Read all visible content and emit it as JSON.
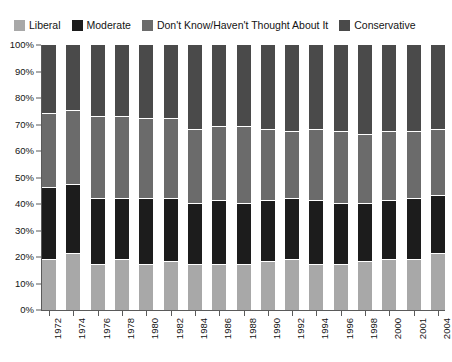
{
  "legend": {
    "position": "top",
    "items": [
      {
        "label": "Liberal",
        "color": "#a8a8a8",
        "icon": "legend-swatch-icon"
      },
      {
        "label": "Moderate",
        "color": "#1c1c1c",
        "icon": "legend-swatch-icon"
      },
      {
        "label": "Don't Know/Haven't Thought About It",
        "color": "#6b6b6b",
        "icon": "legend-swatch-icon"
      },
      {
        "label": "Conservative",
        "color": "#4a4a4a",
        "icon": "legend-swatch-icon"
      }
    ]
  },
  "axes": {
    "y_ticks": [
      "100%",
      "90%",
      "80%",
      "70%",
      "60%",
      "50%",
      "40%",
      "30%",
      "20%",
      "10%",
      "0%"
    ],
    "ylim": [
      0,
      100
    ],
    "grid": false
  },
  "chart_data": {
    "type": "bar",
    "title": "",
    "xlabel": "",
    "ylabel": "",
    "ylim": [
      0,
      100
    ],
    "grid": false,
    "stacked": true,
    "stack_order_bottom_to_top": [
      "Liberal",
      "Moderate",
      "Don't Know/Haven't Thought About It",
      "Conservative"
    ],
    "categories": [
      "1972",
      "1974",
      "1976",
      "1978",
      "1980",
      "1982",
      "1984",
      "1986",
      "1988",
      "1990",
      "1992",
      "1994",
      "1996",
      "1998",
      "2000",
      "2001",
      "2004"
    ],
    "series": [
      {
        "name": "Liberal",
        "color": "#a8a8a8",
        "values": [
          19,
          21,
          17,
          19,
          17,
          18,
          17,
          17,
          17,
          18,
          19,
          17,
          17,
          18,
          19,
          19,
          21
        ]
      },
      {
        "name": "Moderate",
        "color": "#1c1c1c",
        "values": [
          27,
          26,
          25,
          23,
          25,
          24,
          23,
          24,
          23,
          23,
          23,
          24,
          23,
          22,
          22,
          23,
          22
        ]
      },
      {
        "name": "Don't Know/Haven't Thought About It",
        "color": "#6b6b6b",
        "values": [
          28,
          28,
          31,
          31,
          30,
          30,
          28,
          28,
          29,
          27,
          25,
          27,
          27,
          26,
          26,
          25,
          25
        ]
      },
      {
        "name": "Conservative",
        "color": "#4a4a4a",
        "values": [
          26,
          25,
          27,
          27,
          28,
          28,
          32,
          31,
          31,
          32,
          33,
          32,
          33,
          34,
          33,
          33,
          32
        ]
      }
    ]
  }
}
